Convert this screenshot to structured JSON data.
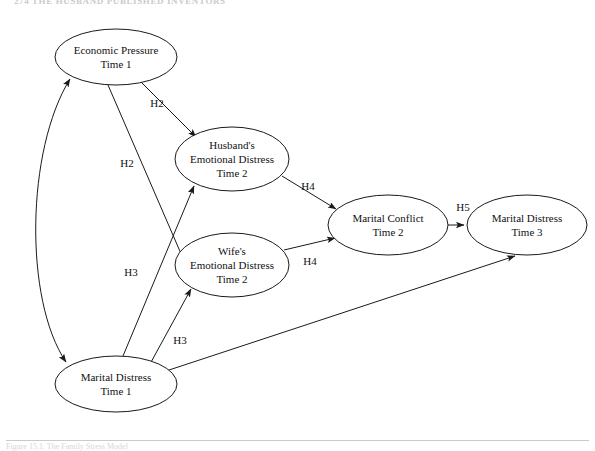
{
  "page": {
    "running_head": "274    THE HUSBAND PUBLISHED INVENTORS",
    "caption": "Figure 15.1.  The Family Stress Model"
  },
  "diagram": {
    "type": "path-diagram",
    "stroke_color": "#1a1a1a",
    "fill_color": "#ffffff",
    "nodes": [
      {
        "id": "economic-pressure-t1",
        "lines": [
          "Economic Pressure",
          "Time 1"
        ],
        "cx": 116,
        "cy": 57,
        "rx": 61,
        "ry": 28
      },
      {
        "id": "husband-distress-t2",
        "lines": [
          "Husband's",
          "Emotional Distress",
          "Time 2"
        ],
        "cx": 232,
        "cy": 159,
        "rx": 57,
        "ry": 32
      },
      {
        "id": "wife-distress-t2",
        "lines": [
          "Wife's",
          "Emotional Distress",
          "Time 2"
        ],
        "cx": 232,
        "cy": 265,
        "rx": 57,
        "ry": 32
      },
      {
        "id": "marital-conflict-t2",
        "lines": [
          "Marital Conflict",
          "Time 2"
        ],
        "cx": 388,
        "cy": 225,
        "rx": 60,
        "ry": 30
      },
      {
        "id": "marital-distress-t3",
        "lines": [
          "Marital Distress",
          "Time 3"
        ],
        "cx": 527,
        "cy": 225,
        "rx": 60,
        "ry": 30
      },
      {
        "id": "marital-distress-t1",
        "lines": [
          "Marital Distress",
          "Time 1"
        ],
        "cx": 116,
        "cy": 384,
        "rx": 61,
        "ry": 28
      }
    ],
    "edges": [
      {
        "id": "ep-to-husband",
        "from": "economic-pressure-t1",
        "to": "husband-distress-t2",
        "label": "H2",
        "label_x": 157,
        "label_y": 107
      },
      {
        "id": "ep-to-wife",
        "from": "economic-pressure-t1",
        "to": "wife-distress-t2",
        "label": "H2",
        "label_x": 127,
        "label_y": 167
      },
      {
        "id": "md1-to-husband",
        "from": "marital-distress-t1",
        "to": "husband-distress-t2",
        "label": "H3",
        "label_x": 131,
        "label_y": 276
      },
      {
        "id": "md1-to-wife",
        "from": "marital-distress-t1",
        "to": "wife-distress-t2",
        "label": "H3",
        "label_x": 180,
        "label_y": 344
      },
      {
        "id": "husband-to-conflict",
        "from": "husband-distress-t2",
        "to": "marital-conflict-t2",
        "label": "H4",
        "label_x": 308,
        "label_y": 190
      },
      {
        "id": "wife-to-conflict",
        "from": "wife-distress-t2",
        "to": "marital-conflict-t2",
        "label": "H4",
        "label_x": 310,
        "label_y": 265
      },
      {
        "id": "conflict-to-md3",
        "from": "marital-conflict-t2",
        "to": "marital-distress-t3",
        "label": "H5",
        "label_x": 463,
        "label_y": 211
      },
      {
        "id": "md1-to-md3",
        "from": "marital-distress-t1",
        "to": "marital-distress-t3",
        "label": "",
        "label_x": 0,
        "label_y": 0
      },
      {
        "id": "ep-md1-correlation",
        "from": "economic-pressure-t1",
        "to": "marital-distress-t1",
        "label": "",
        "label_x": 0,
        "label_y": 0,
        "bidirectional": true
      }
    ]
  }
}
